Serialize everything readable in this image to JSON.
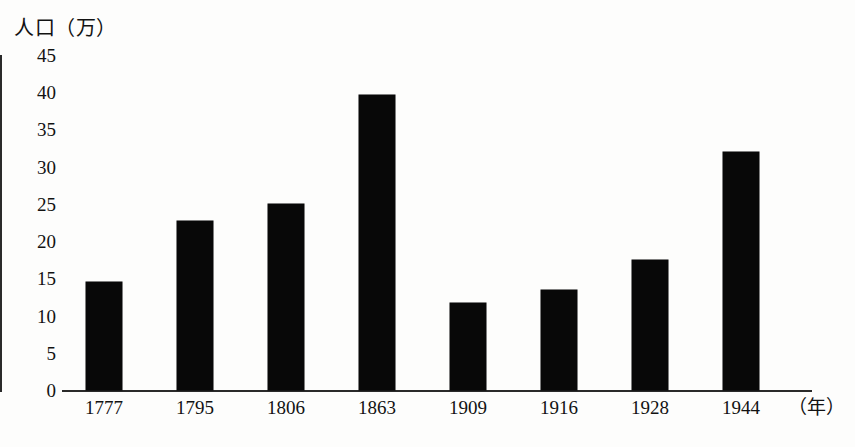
{
  "chart_data": {
    "type": "bar",
    "title": "",
    "subtitle": "",
    "ylabel": "人口（万）",
    "xlabel": "（年）",
    "categories": [
      "1777",
      "1795",
      "1806",
      "1863",
      "1909",
      "1916",
      "1928",
      "1944"
    ],
    "values": [
      14.5,
      22.7,
      25.0,
      39.6,
      11.7,
      13.4,
      17.5,
      32.0
    ],
    "series": [
      {
        "name": "人口（万）",
        "values": [
          14.5,
          22.7,
          25.0,
          39.6,
          11.7,
          13.4,
          17.5,
          32.0
        ]
      }
    ],
    "ylim": [
      0,
      45
    ],
    "ytick_labels": [
      "45",
      "40",
      "35",
      "30",
      "25",
      "20",
      "15",
      "10",
      "5",
      "0"
    ],
    "ytick_values": [
      45,
      40,
      35,
      30,
      25,
      20,
      15,
      10,
      5,
      0
    ],
    "grid": false,
    "legend": "none",
    "bar_color": "#080808",
    "axis_color": "#2a2a2a",
    "background_color": "#fdfdfc"
  },
  "axis": {
    "y_title": "人口（万）",
    "x_unit": "（年）"
  }
}
